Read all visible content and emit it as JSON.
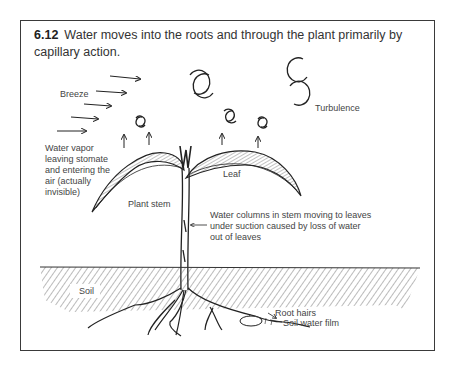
{
  "figure": {
    "number": "6.12",
    "caption": "Water moves into the roots and through the plant primarily by capillary action."
  },
  "labels": {
    "breeze": "Breeze",
    "turbulence": "Turbulence",
    "water_vapor_1": "Water vapor",
    "water_vapor_2": "leaving stomate",
    "water_vapor_3": "and entering the",
    "water_vapor_4": "air (actually",
    "water_vapor_5": "invisible)",
    "leaf": "Leaf",
    "plant_stem": "Plant stem",
    "water_columns_1": "Water columns in stem moving to leaves",
    "water_columns_2": "under suction caused by loss of water",
    "water_columns_3": "out of leaves",
    "soil": "Soil",
    "root_hairs": "Root hairs",
    "soil_water_film": "Soil water film"
  }
}
